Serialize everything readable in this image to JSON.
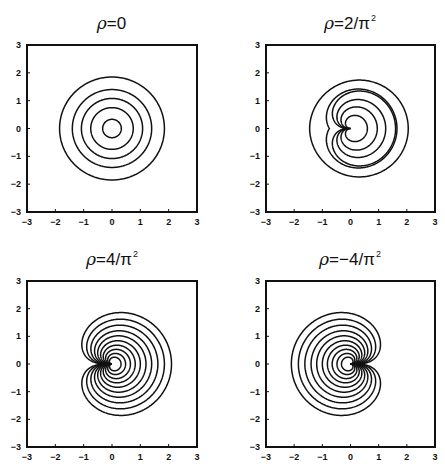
{
  "chart_data": [
    {
      "type": "contour",
      "id": "tl",
      "title": "ρ=0",
      "title_parts": {
        "sym": "ρ",
        "rest": "=0",
        "sup": ""
      },
      "frame": {
        "left": 27,
        "top": 45,
        "right": 197,
        "bottom": 212
      },
      "title_pos": {
        "cx": 112,
        "y": 13
      },
      "xlim": [
        -3,
        3
      ],
      "ylim": [
        -3,
        3
      ],
      "xticks": [
        -3,
        -2,
        -1,
        0,
        1,
        2,
        3
      ],
      "yticks": [
        -3,
        -2,
        -1,
        0,
        1,
        2,
        3
      ],
      "grid": false,
      "direction": 1,
      "contours": [
        {
          "c": 0.33,
          "a": 0,
          "k": 1
        },
        {
          "c": 0.75,
          "a": 0,
          "k": 1
        },
        {
          "c": 1.08,
          "a": 0,
          "k": 1
        },
        {
          "c": 1.4,
          "a": 0,
          "k": 1
        },
        {
          "c": 1.85,
          "a": 0,
          "k": 1
        }
      ]
    },
    {
      "type": "contour",
      "id": "tr",
      "title": "ρ=2/π²",
      "title_parts": {
        "sym": "ρ",
        "rest": "=2/π",
        "sup": "2"
      },
      "frame": {
        "left": 266,
        "top": 45,
        "right": 435,
        "bottom": 212
      },
      "title_pos": {
        "cx": 350,
        "y": 13
      },
      "xlim": [
        -3,
        3
      ],
      "ylim": [
        -3,
        3
      ],
      "xticks": [
        -3,
        -2,
        -1,
        0,
        1,
        2,
        3
      ],
      "yticks": [
        -3,
        -2,
        -1,
        0,
        1,
        2,
        3
      ],
      "grid": false,
      "direction": 1,
      "contours": [
        {
          "c": 1.45,
          "a": 0.6,
          "k": 1.2
        },
        {
          "c": 0.75,
          "a": 0.9,
          "k": 0.5
        },
        {
          "c": 0,
          "a": 1.6,
          "k": 0.3
        },
        {
          "c": 0,
          "a": 1.25,
          "k": 0.32
        },
        {
          "c": 0,
          "a": 0.95,
          "k": 0.36
        },
        {
          "c": 0,
          "a": 0.6,
          "k": 0.45
        }
      ]
    },
    {
      "type": "contour",
      "id": "bl",
      "title": "ρ=4/π²",
      "title_parts": {
        "sym": "ρ",
        "rest": "=4/π",
        "sup": "2"
      },
      "frame": {
        "left": 27,
        "top": 281,
        "right": 197,
        "bottom": 447
      },
      "title_pos": {
        "cx": 112,
        "y": 249
      },
      "xlim": [
        -3,
        3
      ],
      "ylim": [
        -3,
        3
      ],
      "xticks": [
        -3,
        -2,
        -1,
        0,
        1,
        2,
        3
      ],
      "yticks": [
        -3,
        -2,
        -1,
        0,
        1,
        2,
        3
      ],
      "grid": false,
      "direction": 1,
      "contours": [
        {
          "c": 0,
          "a": 2.1,
          "k": 0.2
        },
        {
          "c": 0,
          "a": 1.85,
          "k": 0.22
        },
        {
          "c": 0,
          "a": 1.62,
          "k": 0.24
        },
        {
          "c": 0,
          "a": 1.4,
          "k": 0.26
        },
        {
          "c": 0,
          "a": 1.2,
          "k": 0.28
        },
        {
          "c": 0,
          "a": 1.0,
          "k": 0.3
        },
        {
          "c": 0,
          "a": 0.82,
          "k": 0.33
        },
        {
          "c": 0,
          "a": 0.65,
          "k": 0.37
        },
        {
          "c": 0,
          "a": 0.48,
          "k": 0.42
        },
        {
          "c": 0,
          "a": 0.32,
          "k": 0.5
        }
      ]
    },
    {
      "type": "contour",
      "id": "br",
      "title": "ρ=-4/π²",
      "title_parts": {
        "sym": "ρ",
        "rest": "=−4/π",
        "sup": "2"
      },
      "frame": {
        "left": 266,
        "top": 281,
        "right": 435,
        "bottom": 447
      },
      "title_pos": {
        "cx": 350,
        "y": 249
      },
      "xlim": [
        -3,
        3
      ],
      "ylim": [
        -3,
        3
      ],
      "xticks": [
        -3,
        -2,
        -1,
        0,
        1,
        2,
        3
      ],
      "yticks": [
        -3,
        -2,
        -1,
        0,
        1,
        2,
        3
      ],
      "grid": false,
      "direction": -1,
      "contours": [
        {
          "c": 0,
          "a": 2.1,
          "k": 0.2
        },
        {
          "c": 0,
          "a": 1.85,
          "k": 0.22
        },
        {
          "c": 0,
          "a": 1.62,
          "k": 0.24
        },
        {
          "c": 0,
          "a": 1.4,
          "k": 0.26
        },
        {
          "c": 0,
          "a": 1.2,
          "k": 0.28
        },
        {
          "c": 0,
          "a": 1.0,
          "k": 0.3
        },
        {
          "c": 0,
          "a": 0.82,
          "k": 0.33
        },
        {
          "c": 0,
          "a": 0.65,
          "k": 0.37
        },
        {
          "c": 0,
          "a": 0.48,
          "k": 0.42
        },
        {
          "c": 0,
          "a": 0.32,
          "k": 0.5
        }
      ]
    }
  ],
  "style": {
    "line_color": "#111111",
    "frame_color": "#111111",
    "background": "#ffffff"
  }
}
